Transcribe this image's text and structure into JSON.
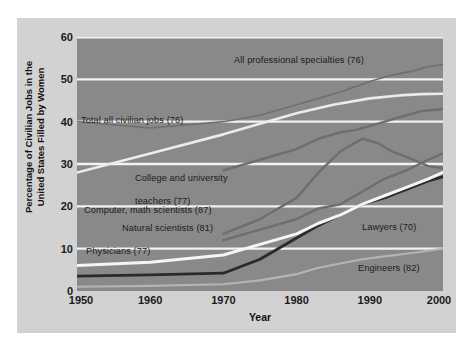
{
  "chart_data": {
    "type": "line",
    "title": "",
    "xlabel": "Year",
    "ylabel": "Percentage of Civilian Jobs in the\nUnited States Filled by Women",
    "xlim": [
      1950,
      2000
    ],
    "ylim": [
      0,
      60
    ],
    "xticks": [
      "1950",
      "1960",
      "1970",
      "1980",
      "1990",
      "2000"
    ],
    "xtick_values": [
      1950,
      1960,
      1970,
      1980,
      1990,
      2000
    ],
    "yticks": [
      "0",
      "10",
      "20",
      "30",
      "40",
      "50",
      "60"
    ],
    "ytick_values": [
      0,
      10,
      20,
      30,
      40,
      50,
      60
    ],
    "grid": "horizontal-white-gridlines",
    "legend": "inline-labels-on-plot",
    "plot_background": "#898989",
    "figure_background": "#d2d2d2",
    "gridline_color": "#f2f2f2",
    "series": [
      {
        "name": "All professional specialties (76)",
        "label": "All professional specialties (76)",
        "color": "#707070",
        "width": 1.6,
        "x": [
          1950,
          1960,
          1970,
          1975,
          1980,
          1983,
          1986,
          1990,
          1993,
          1996,
          1998,
          2000
        ],
        "values": [
          40.0,
          38.5,
          40.0,
          41.5,
          44.0,
          45.5,
          47.0,
          49.5,
          51.0,
          52.0,
          53.0,
          53.5
        ]
      },
      {
        "name": "Total all civilian jobs (76)",
        "label": "Total all civilian jobs (76)",
        "color": "#ebebeb",
        "width": 2.6,
        "x": [
          1950,
          1960,
          1970,
          1975,
          1980,
          1985,
          1990,
          1994,
          1997,
          2000
        ],
        "values": [
          28.0,
          32.5,
          37.0,
          39.5,
          42.0,
          44.0,
          45.5,
          46.2,
          46.5,
          46.6
        ]
      },
      {
        "name": "College and university teachers (77)",
        "label": "College and university\nteachers (77)",
        "color": "#6e6e6e",
        "width": 2.4,
        "x": [
          1970,
          1975,
          1980,
          1983,
          1986,
          1988,
          1991,
          1994,
          1997,
          2000
        ],
        "values": [
          28.5,
          31.0,
          33.5,
          36.0,
          37.5,
          38.0,
          39.5,
          41.0,
          42.5,
          43.0
        ]
      },
      {
        "name": "Computer, math scientists (87)",
        "label": "Computer, math scientists (87)",
        "color": "#6e6e6e",
        "width": 2.4,
        "x": [
          1970,
          1975,
          1980,
          1983,
          1986,
          1989,
          1991,
          1993,
          1996,
          1998,
          2000
        ],
        "values": [
          13.5,
          17.0,
          22.0,
          28.0,
          33.0,
          36.0,
          35.0,
          33.0,
          31.0,
          29.5,
          29.0
        ]
      },
      {
        "name": "Natural scientists (81)",
        "label": "Natural scientists (81)",
        "color": "#6e6e6e",
        "width": 2.4,
        "x": [
          1970,
          1975,
          1980,
          1983,
          1986,
          1989,
          1992,
          1995,
          1998,
          2000
        ],
        "values": [
          12.0,
          14.5,
          17.0,
          19.5,
          20.5,
          23.5,
          26.5,
          28.5,
          31.0,
          32.5
        ]
      },
      {
        "name": "Lawyers (70)",
        "label": "Lawyers (70)",
        "color": "#2a2a2a",
        "width": 2.8,
        "x": [
          1950,
          1960,
          1970,
          1975,
          1980,
          1983,
          1986,
          1989,
          1992,
          1995,
          1998,
          2000
        ],
        "values": [
          3.5,
          3.8,
          4.2,
          7.5,
          12.5,
          15.5,
          18.0,
          20.5,
          22.0,
          24.0,
          26.0,
          27.0
        ]
      },
      {
        "name": "Physicians (77)",
        "label": "Physicians (77)",
        "color": "#f5f5f5",
        "width": 3.0,
        "x": [
          1950,
          1960,
          1970,
          1975,
          1980,
          1983,
          1986,
          1989,
          1992,
          1995,
          1998,
          2000
        ],
        "values": [
          6.0,
          6.8,
          8.5,
          11.0,
          13.5,
          16.0,
          18.0,
          20.5,
          22.5,
          24.5,
          26.5,
          28.0
        ]
      },
      {
        "name": "Engineers (82)",
        "label": "Engineers (82)",
        "color": "#b4b4b4",
        "width": 2.2,
        "x": [
          1950,
          1960,
          1970,
          1975,
          1980,
          1983,
          1986,
          1989,
          1992,
          1995,
          1998,
          2000
        ],
        "values": [
          1.0,
          1.2,
          1.6,
          2.5,
          4.0,
          5.5,
          6.5,
          7.5,
          8.2,
          8.8,
          9.5,
          10.0
        ]
      }
    ],
    "annotations": [
      {
        "text": "All professional specialties (76)",
        "x_px": 234,
        "y_px": 60
      },
      {
        "text": "Total all civilian jobs (76)",
        "x_px": 81,
        "y_px": 120
      },
      {
        "text": "College and university\nteachers (77)",
        "x_px": 135,
        "y_px": 166
      },
      {
        "text": "Computer, math scientists (87)",
        "x_px": 84,
        "y_px": 210
      },
      {
        "text": "Natural scientists (81)",
        "x_px": 120,
        "y_px": 228
      },
      {
        "text": "Physicians (77)",
        "x_px": 86,
        "y_px": 250
      },
      {
        "text": "Lawyers (70)",
        "x_px": 362,
        "y_px": 226
      },
      {
        "text": "Engineers (82)",
        "x_px": 358,
        "y_px": 267
      }
    ]
  },
  "axis": {
    "y_title": "Percentage of Civilian Jobs in the United States Filled by Women",
    "y_title_line1": "Percentage of Civilian Jobs in the",
    "y_title_line2": "United States Filled by Women",
    "x_title": "Year",
    "y_labels": [
      "60",
      "50",
      "40",
      "30",
      "20",
      "10",
      "0"
    ],
    "x_labels": [
      "1950",
      "1960",
      "1970",
      "1980",
      "1990",
      "2000"
    ]
  },
  "labels": {
    "all_professional": "All professional specialties (76)",
    "total_civilian": "Total all civilian jobs (76)",
    "college_teachers_line1": "College and university",
    "college_teachers_line2": "teachers (77)",
    "computer_math": "Computer, math scientists (87)",
    "natural_scientists": "Natural scientists (81)",
    "physicians": "Physicians (77)",
    "lawyers": "Lawyers (70)",
    "engineers": "Engineers (82)"
  }
}
